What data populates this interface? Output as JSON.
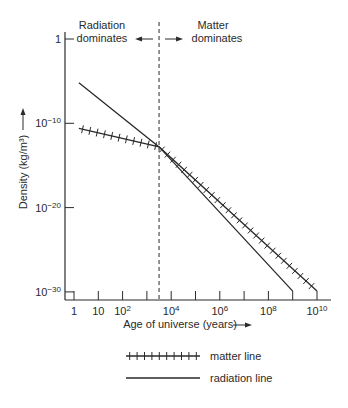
{
  "chart_data": {
    "type": "line",
    "title": "",
    "xlabel": "Age of universe (years)",
    "ylabel": "Density (kg/m³)",
    "x_scale": "log",
    "y_scale": "log",
    "xlim_log10": [
      -0.4,
      10.5
    ],
    "ylim_log10": [
      -30.9,
      0.8
    ],
    "x_ticks_log10": [
      0,
      1,
      2,
      3,
      4,
      5,
      6,
      7,
      8,
      9,
      10
    ],
    "x_tick_labels": [
      {
        "log10": 0,
        "base": "1",
        "exp": ""
      },
      {
        "log10": 1,
        "base": "10",
        "exp": ""
      },
      {
        "log10": 2,
        "base": "10",
        "exp": "2"
      },
      {
        "log10": 4,
        "base": "10",
        "exp": "4"
      },
      {
        "log10": 6,
        "base": "10",
        "exp": "6"
      },
      {
        "log10": 8,
        "base": "10",
        "exp": "8"
      },
      {
        "log10": 10,
        "base": "10",
        "exp": "10"
      }
    ],
    "y_tick_labels": [
      {
        "log10": 0,
        "base": "1",
        "exp": ""
      },
      {
        "log10": -10,
        "base": "10",
        "exp": "−10"
      },
      {
        "log10": -20,
        "base": "10",
        "exp": "−20"
      },
      {
        "log10": -30,
        "base": "10",
        "exp": "−30"
      }
    ],
    "series": [
      {
        "name": "radiation line",
        "style": "solid",
        "points_log10": [
          [
            0.2,
            -5.2
          ],
          [
            3.5,
            -12.8
          ],
          [
            9.0,
            -29.9
          ]
        ]
      },
      {
        "name": "matter line",
        "style": "ticked",
        "points_log10": [
          [
            0.2,
            -10.6
          ],
          [
            3.5,
            -12.8
          ],
          [
            10.0,
            -29.9
          ]
        ]
      }
    ],
    "divider": {
      "x_log10": 3.5,
      "style": "dashed",
      "left_label": [
        "Radiation",
        "dominates"
      ],
      "right_label": [
        "Matter",
        "dominates"
      ]
    },
    "legend": {
      "placement": "bottom-center",
      "entries": [
        {
          "label": "matter line",
          "style": "ticked"
        },
        {
          "label": "radiation line",
          "style": "solid"
        }
      ]
    },
    "grid": false
  },
  "colors": {
    "ink": "#2a2a2a",
    "background": "#ffffff"
  }
}
